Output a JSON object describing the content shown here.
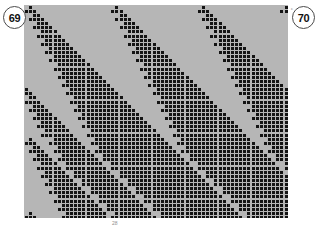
{
  "page": {
    "left_badge": "69",
    "right_badge": "70",
    "corner_mark": "c",
    "caption_mark": "28"
  },
  "figure": {
    "background_color": "#b6b6b6",
    "cell_color": "#141414",
    "grid": {
      "columns": 64,
      "rows": 52,
      "cell_size_px": 4.125,
      "origin_x_px": 24,
      "origin_y_px": 5,
      "width_px": 264,
      "height_px": 213
    },
    "rule": {
      "name": "elementary cellular automaton",
      "number": 30,
      "neighborhood": 3,
      "states": 2
    },
    "chart_data": {
      "type": "heatmap",
      "title": "Cellular automaton evolution",
      "xlabel": "cell position",
      "ylabel": "time step",
      "legend": [],
      "grid_on": true,
      "xlim": [
        0,
        64
      ],
      "ylim": [
        0,
        52
      ],
      "categories": [],
      "values": [
        "0100000000000000000000100000000000000000000100000000000000000001",
        "1110000000000000000001110000000000000000001110000000000000000011",
        "0011000000000000000000011000000000000000000011000000000000000000",
        "0111100000000000000000111100000000000000000111100000000000000000",
        "0001110000000000000000001110000000000000000001110000000000000000",
        "0011111000000000000000011111000000000000000011111000000000000000",
        "0000111100000000000000000111100000000000000000111100000000000000",
        "0001111110000000000000001111110000000000000001111110000000000000",
        "0000011111000000000000000011111000000000000000011111000000000000",
        "0000111111100000000000000111111100000000000000111111100000000000",
        "0000001111110000000000000001111110000000000000001111110000000000",
        "0000011111111000000000000011111111000000000000011111111000000000",
        "0000000111111100000000000000111111100000000000000111111100000000",
        "0000001111111110000000000001111111110000000000001111111110000000",
        "0000000011111111000000000000011111111000000000000011111111000000",
        "0000000111111111100000000000111111111100000000000111111111100000",
        "0000000001111111110000000000001111111110000000000001111111110000",
        "0000000011111111111000000000011111111111000000000011111111111000",
        "0000000000111111111100000000000111111111100000000000111111111100",
        "0000000001111111111110000000001111111111110000000001111111111110",
        "1000000000011111111111000000000011111111111000000000011111111111",
        "1100000000111111111111100000000111111111111100000000111111111111",
        "0110000000001111111111110000000001111111111110000000001111111111",
        "1111000000011111111111111000000011111111111111000000011111111111",
        "0011100000000111111111111100000000111111111111100000000111111111",
        "0111110000001111111111111110000001111111111111110000001111111111",
        "0001111000000011111111111111000000011111111111111000000011111111",
        "0011111100000111111111111111100000111111111111111100000111111111",
        "0000111110000001111111111111110000001111111111111110000001111111",
        "0001111111000011111111111111111000011111111111111111000011111111",
        "0000011111100000111111111111111100000111111111111111100000111111",
        "0000111111110001111111111111111110001111111111111111110001111111",
        "0100000111111000011111111111111111000011111111111111111000011111",
        "1110001111111100111111111111111111100111111111111111111100111111",
        "0011000011111110001111111111111111110001111111111111111110001111",
        "0111100111111111011111111111111111111011111111111111111111011111",
        "0001110001111111100111111111111111111100111111111111111111100111",
        "0011111011111111110111111111111111111110111111111111111111110111",
        "0000111100111111111001111111111111111111001111111111111111111001",
        "0001111110111111111101111111111111111111101111111111111111111101",
        "0000011111001111111110011111111111111111110011111111111111111110",
        "0000111111101111111111011111111111111111111011111111111111111111",
        "0000001111110011111111100111111111111111111100111111111111111111",
        "0000011111111011111111110111111111111111111110111111111111111111",
        "0000000111111100111111111001111111111111111111001111111111111111",
        "0000001111111110111111111101111111111111111111101111111111111111",
        "0000000011111111001111111110011111111111111111110011111111111111",
        "0000000111111111101111111111011111111111111111111011111111111111",
        "0000000001111111110011111111100111111111111111111100111111111111",
        "0000000011111111111011111111110111111111111111111110111111111111",
        "0100000000111111111100111111111001111111111111111111001111111111",
        "1110000001111111111101111111111101111111111111111111101111111111"
      ]
    }
  }
}
